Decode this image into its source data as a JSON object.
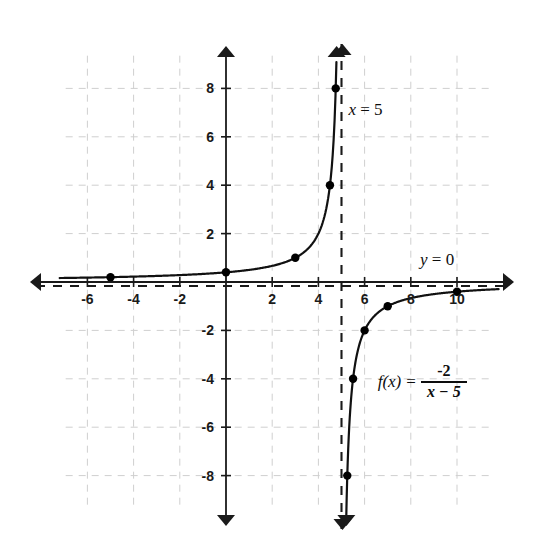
{
  "chart_data": {
    "type": "line",
    "title": "",
    "xlabel": "",
    "ylabel": "",
    "xlim": [
      -7.2,
      11.8
    ],
    "ylim": [
      -9.6,
      9.6
    ],
    "grid": true,
    "grid_step": 2,
    "legend_position": "none",
    "function_expression": "f(x) = -2 / (x - 5)",
    "xticks": [
      -6,
      -4,
      -2,
      2,
      4,
      6,
      8,
      10
    ],
    "xtick_labels": [
      "-6",
      "-4",
      "-2",
      "2",
      "4",
      "6",
      "8",
      "10"
    ],
    "yticks": [
      8,
      6,
      4,
      2,
      -2,
      -4,
      -6,
      -8
    ],
    "ytick_labels": [
      "8",
      "6",
      "4",
      "2",
      "-2",
      "-4",
      "-6",
      "-8"
    ],
    "asymptotes": [
      {
        "name": "vertical-asymptote",
        "label": "x = 5",
        "type": "vertical",
        "value": 5,
        "style": "dashed"
      },
      {
        "name": "horizontal-asymptote",
        "label": "y = 0",
        "type": "horizontal",
        "value": 0,
        "style": "dashed"
      }
    ],
    "series": [
      {
        "name": "left-branch",
        "points": [
          {
            "x": -7.2,
            "y": 0.164
          },
          {
            "x": -5,
            "y": 0.2
          },
          {
            "x": -3,
            "y": 0.25
          },
          {
            "x": -1,
            "y": 0.333
          },
          {
            "x": 0,
            "y": 0.4
          },
          {
            "x": 1,
            "y": 0.5
          },
          {
            "x": 2,
            "y": 0.667
          },
          {
            "x": 3,
            "y": 1
          },
          {
            "x": 4,
            "y": 2
          },
          {
            "x": 4.5,
            "y": 4
          },
          {
            "x": 4.75,
            "y": 8
          },
          {
            "x": 4.8,
            "y": 10
          }
        ],
        "marked_points": [
          {
            "x": -5,
            "y": 0.2
          },
          {
            "x": 0,
            "y": 0.4
          },
          {
            "x": 3,
            "y": 1
          },
          {
            "x": 4.5,
            "y": 4
          },
          {
            "x": 4.75,
            "y": 8
          }
        ]
      },
      {
        "name": "right-branch",
        "points": [
          {
            "x": 5.2,
            "y": -10
          },
          {
            "x": 5.25,
            "y": -8
          },
          {
            "x": 5.5,
            "y": -4
          },
          {
            "x": 6,
            "y": -2
          },
          {
            "x": 7,
            "y": -1
          },
          {
            "x": 8,
            "y": -0.667
          },
          {
            "x": 9,
            "y": -0.5
          },
          {
            "x": 10,
            "y": -0.4
          },
          {
            "x": 11.8,
            "y": -0.294
          }
        ],
        "marked_points": [
          {
            "x": 5.25,
            "y": -8
          },
          {
            "x": 5.5,
            "y": -4
          },
          {
            "x": 6,
            "y": -2
          },
          {
            "x": 7,
            "y": -1
          },
          {
            "x": 10,
            "y": -0.4
          }
        ]
      }
    ],
    "annotations": [
      {
        "name": "x-equals-5-label",
        "text": "x = 5",
        "x": 5.3,
        "y": 6.9
      },
      {
        "name": "y-equals-0-label",
        "text": "y = 0",
        "x": 8.4,
        "y": 0.7
      }
    ]
  },
  "labels": {
    "vertical_asymptote": "x = 5",
    "horizontal_asymptote": "y = 0",
    "formula_fx": "f(x)",
    "formula_equals": "=",
    "formula_numerator": "-2",
    "formula_denominator": "x − 5"
  },
  "colors": {
    "axis": "#1a1a1a",
    "curve": "#111111",
    "grid": "#cfcfcf",
    "asymptote": "#1a1a1a",
    "background": "#ffffff",
    "point": "#000000"
  }
}
